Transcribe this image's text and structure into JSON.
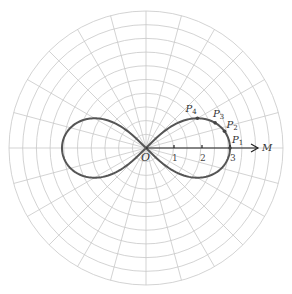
{
  "diagram": {
    "center": {
      "x": 146,
      "y": 148
    },
    "outer_radius": 137,
    "ring_count": 10,
    "spoke_step_deg": 15,
    "unit_px": 28,
    "colors": {
      "grid": "#c8c8c8",
      "curve": "#555555",
      "axis": "#222222"
    },
    "curve": {
      "equation": "r^2 = 9 cos(2θ)",
      "a": 3
    },
    "pole_label": "O",
    "axis_label": "M",
    "axis_end_units": 4.0,
    "ticks": [
      {
        "value": 1,
        "label": "1"
      },
      {
        "value": 2,
        "label": "2"
      },
      {
        "value": 3,
        "label": "3"
      }
    ],
    "points": [
      {
        "name": "P",
        "sub": "1",
        "theta_deg": 0
      },
      {
        "name": "P",
        "sub": "2",
        "theta_deg": 12
      },
      {
        "name": "P",
        "sub": "3",
        "theta_deg": 20
      },
      {
        "name": "P",
        "sub": "4",
        "theta_deg": 30
      }
    ]
  }
}
